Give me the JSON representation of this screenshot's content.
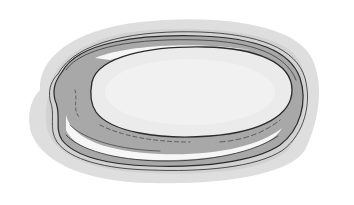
{
  "illustration": {
    "subject": "sketched flat oval stone / dish with layered rim",
    "style": "grayscale ink sketch with wash shading",
    "colors": {
      "background": "#ffffff",
      "shadow_wash": "#e2e2e2",
      "outer_wash": "#d4d4d4",
      "rim_fill": "#a9a9a9",
      "rim_highlight": "#f8f8f8",
      "inner_surface": "#ebebeb",
      "center_highlight": "#f2f2f2",
      "ink": "#2a2a2a"
    }
  }
}
